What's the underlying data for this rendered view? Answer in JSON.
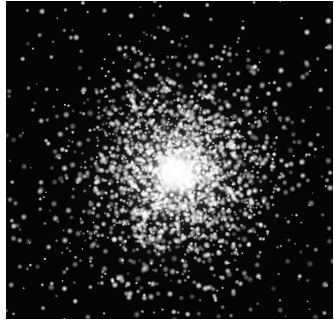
{
  "image": {
    "subject": "globular star cluster",
    "description": "Dense spherical cluster of stars on black sky, bright white core slightly below center",
    "background_color": "#050505",
    "frame_color": "#ffffff",
    "core": {
      "x_pct": 0.52,
      "y_pct": 0.54,
      "radius_pct": 0.07
    },
    "halo_radius_pct": 0.42
  }
}
